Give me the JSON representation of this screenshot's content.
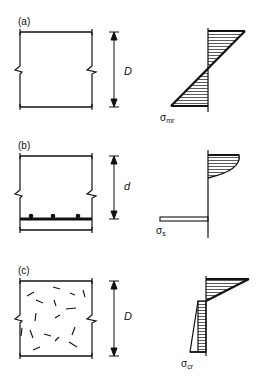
{
  "figure": {
    "panels": [
      {
        "id": "a",
        "label": "(a)",
        "dimension_label": "D",
        "stress_label_main": "σ",
        "stress_label_sub": "mr",
        "description": "Plain concrete section with linear stress distribution"
      },
      {
        "id": "b",
        "label": "(b)",
        "dimension_label": "d",
        "stress_label_main": "σ",
        "stress_label_sub": "s",
        "description": "Reinforced concrete section with parabolic compression block and steel tension"
      },
      {
        "id": "c",
        "label": "(c)",
        "dimension_label": "D",
        "stress_label_main": "σ",
        "stress_label_sub": "cr",
        "description": "Fibre reinforced concrete section with triangular compression and residual tension block"
      }
    ]
  }
}
